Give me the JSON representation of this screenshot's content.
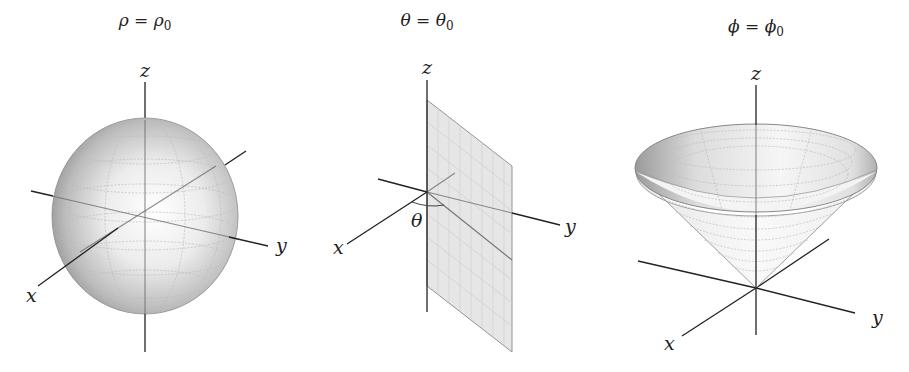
{
  "panels": [
    {
      "id": "sphere",
      "title": "ρ = ρ₀",
      "title_parts": {
        "lhs": "ρ",
        "eq": " = ",
        "rhs": "ρ",
        "sub": "0"
      },
      "surface": "sphere",
      "axis_labels": {
        "x": "x",
        "y": "y",
        "z": "z"
      }
    },
    {
      "id": "half-plane",
      "title": "θ = θ₀",
      "title_parts": {
        "lhs": "θ",
        "eq": " = ",
        "rhs": "θ",
        "sub": "0"
      },
      "surface": "half-plane",
      "axis_labels": {
        "x": "x",
        "y": "y",
        "z": "z"
      },
      "angle_label": "θ"
    },
    {
      "id": "cone",
      "title": "ϕ = ϕ₀",
      "title_parts": {
        "lhs": "ϕ",
        "eq": " = ",
        "rhs": "ϕ",
        "sub": "0"
      },
      "surface": "cone",
      "axis_labels": {
        "x": "x",
        "y": "y",
        "z": "z"
      }
    }
  ],
  "colors": {
    "axis": "#222222",
    "surface_light": "#ffffff",
    "surface_dark": "#8a8a8a",
    "plane_fill": "#e6e6e6",
    "grid": "#bdbdbd"
  }
}
